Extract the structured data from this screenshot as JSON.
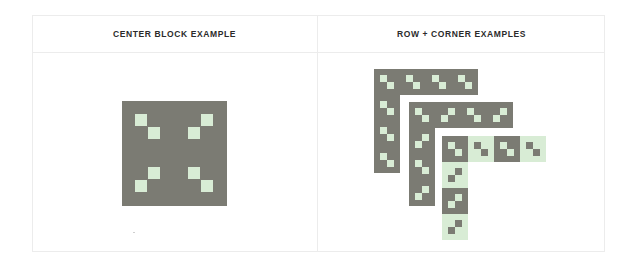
{
  "panels": {
    "left": {
      "title": "CENTER BLOCK EXAMPLE"
    },
    "right": {
      "title": "ROW + CORNER EXAMPLES"
    }
  },
  "colors": {
    "dark": "#7b7b73",
    "light": "#d8ecd5",
    "border": "#ececec",
    "title": "#2b2b2b"
  },
  "center_block": {
    "x": 122,
    "y": 101,
    "size": 105,
    "squares": [
      {
        "x": 135,
        "y": 114
      },
      {
        "x": 148,
        "y": 127
      },
      {
        "x": 201,
        "y": 114
      },
      {
        "x": 188,
        "y": 127
      },
      {
        "x": 148,
        "y": 167
      },
      {
        "x": 135,
        "y": 180
      },
      {
        "x": 188,
        "y": 167
      },
      {
        "x": 201,
        "y": 180
      }
    ],
    "square_size": 12
  },
  "corner_shapes": [
    {
      "name": "outer-l",
      "origin": {
        "x": 374,
        "y": 69
      },
      "cell": 26,
      "row_cells": [
        {
          "bg": "dark",
          "pattern": "down"
        },
        {
          "bg": "dark",
          "pattern": "down"
        },
        {
          "bg": "dark",
          "pattern": "down"
        },
        {
          "bg": "dark",
          "pattern": "down"
        }
      ],
      "col_cells": [
        {
          "bg": "dark",
          "pattern": "down"
        },
        {
          "bg": "dark",
          "pattern": "down"
        },
        {
          "bg": "dark",
          "pattern": "down"
        }
      ]
    },
    {
      "name": "middle-l",
      "origin": {
        "x": 409,
        "y": 102
      },
      "cell": 26,
      "row_cells": [
        {
          "bg": "dark",
          "pattern": "down"
        },
        {
          "bg": "dark",
          "pattern": "up"
        },
        {
          "bg": "dark",
          "pattern": "down"
        },
        {
          "bg": "dark",
          "pattern": "up"
        }
      ],
      "col_cells": [
        {
          "bg": "dark",
          "pattern": "up"
        },
        {
          "bg": "dark",
          "pattern": "down"
        },
        {
          "bg": "dark",
          "pattern": "up"
        }
      ]
    },
    {
      "name": "inner-l",
      "origin": {
        "x": 442,
        "y": 136
      },
      "cell": 26,
      "row_cells": [
        {
          "bg": "dark",
          "pattern": "down"
        },
        {
          "bg": "light",
          "pattern": "down"
        },
        {
          "bg": "dark",
          "pattern": "down"
        },
        {
          "bg": "light",
          "pattern": "down"
        }
      ],
      "col_cells": [
        {
          "bg": "light",
          "pattern": "up"
        },
        {
          "bg": "dark",
          "pattern": "up"
        },
        {
          "bg": "light",
          "pattern": "up"
        }
      ]
    }
  ]
}
